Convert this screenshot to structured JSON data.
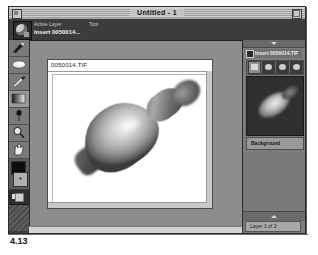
{
  "figure": {
    "caption": "4.13"
  },
  "window": {
    "title": "Untitled - 1",
    "close_icon": "close-box-icon",
    "zoom_icon": "zoom-box-icon"
  },
  "info_bar": {
    "app_icon": "app-logo-icon",
    "active_layer_label": "Active Layer",
    "tool_label": "Tool",
    "active_layer_value": "Insert 0050014..."
  },
  "toolbar": {
    "tools": [
      {
        "name": "brush-tool",
        "icon": "paintbrush-icon"
      },
      {
        "name": "eraser-tool",
        "icon": "eraser-icon"
      },
      {
        "name": "pencil-tool",
        "icon": "pencil-icon"
      },
      {
        "name": "gradient-tool",
        "icon": "gradient-icon"
      },
      {
        "name": "eyedropper-tool",
        "icon": "eyedropper-icon"
      },
      {
        "name": "zoom-tool",
        "icon": "magnifier-icon"
      },
      {
        "name": "hand-tool",
        "icon": "hand-icon"
      }
    ],
    "foreground_swatch": "#0d0d0d",
    "background_swatch": "#b0b0b0"
  },
  "document": {
    "title": "0050014.TIF",
    "artwork": "bowling-pin-photo"
  },
  "palette": {
    "layer_entry": "Insert 0050014.TIF",
    "layer_checked": true,
    "modes": [
      "mode-normal",
      "mode-mask",
      "mode-paint",
      "mode-preview"
    ],
    "thumbnail": "layer-thumbnail",
    "background_label": "Background",
    "status": "Layer 1 of 2",
    "collapse_icon": "triangle-up-icon",
    "expand_icon": "triangle-down-icon"
  },
  "colors": {
    "window_chrome": "#8d8d8d",
    "info_bar": "#3c3c3c",
    "canvas": "#ffffff",
    "palette": "#7d7d7d"
  }
}
